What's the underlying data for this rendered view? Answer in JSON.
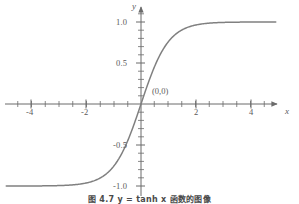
{
  "figure": {
    "caption": "图 4.7  y = tanh x 函数的图像",
    "background_color": "#ffffff",
    "curve_color": "#808080",
    "axis_color": "#6b6b6b",
    "text_color": "#5a5a5a"
  },
  "annotations": {
    "origin_point": "(0,0)"
  },
  "axis_names": {
    "x": "x",
    "y": "y"
  },
  "chart_data": {
    "type": "line",
    "title": "图 4.7  y = tanh x 函数的图像",
    "xlabel": "x",
    "ylabel": "y",
    "xlim": [
      -4.9,
      4.9
    ],
    "ylim": [
      -1.25,
      1.25
    ],
    "grid": false,
    "legend": null,
    "function": "y = tanh(x)",
    "annotations": [
      {
        "text": "(0,0)",
        "x": 0,
        "y": 0
      }
    ],
    "xticks": [
      -4,
      -2,
      2,
      4
    ],
    "xtick_labels": [
      "-4",
      "-2",
      "2",
      "4"
    ],
    "xminor_step": 0.5,
    "yticks": [
      1.0,
      0.5,
      -0.5,
      -1.0
    ],
    "ytick_labels": [
      "1.0",
      "0.5",
      "-0.5",
      "-1.0"
    ],
    "yminor_step": 0.1,
    "series": [
      {
        "name": "y = tanh(x)",
        "color": "#808080",
        "x": [
          -4.9,
          -4.6,
          -4.3,
          -4.0,
          -3.7,
          -3.4,
          -3.1,
          -2.8,
          -2.5,
          -2.2,
          -1.9,
          -1.6,
          -1.3,
          -1.0,
          -0.7,
          -0.4,
          -0.1,
          0.0,
          0.1,
          0.4,
          0.7,
          1.0,
          1.3,
          1.6,
          1.9,
          2.2,
          2.5,
          2.8,
          3.1,
          3.4,
          3.7,
          4.0,
          4.3,
          4.6,
          4.9
        ],
        "y": [
          -0.9999,
          -0.9998,
          -0.9996,
          -0.9993,
          -0.9988,
          -0.9978,
          -0.9959,
          -0.9926,
          -0.9866,
          -0.9757,
          -0.9562,
          -0.9217,
          -0.8617,
          -0.7616,
          -0.6044,
          -0.3799,
          -0.0997,
          0.0,
          0.0997,
          0.3799,
          0.6044,
          0.7616,
          0.8617,
          0.9217,
          0.9562,
          0.9757,
          0.9866,
          0.9926,
          0.9959,
          0.9978,
          0.9988,
          0.9993,
          0.9996,
          0.9998,
          0.9999
        ]
      }
    ]
  }
}
